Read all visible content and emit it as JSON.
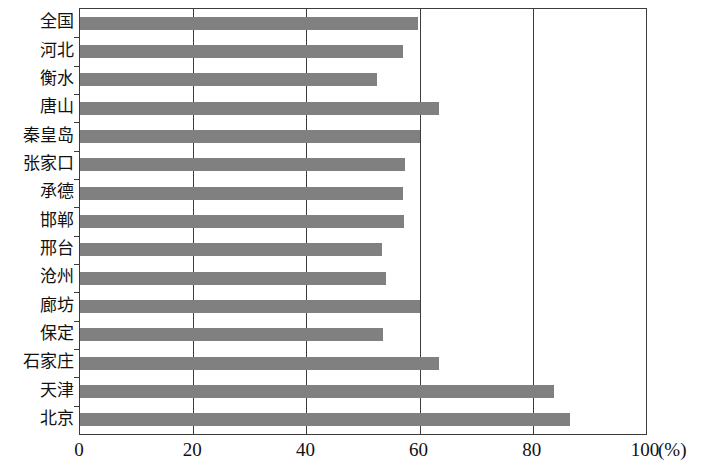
{
  "chart_data": {
    "type": "bar",
    "orientation": "horizontal",
    "title": "",
    "xlabel": "(%)",
    "ylabel": "",
    "xlim": [
      0,
      100
    ],
    "xticks": [
      0,
      20,
      40,
      60,
      80,
      100
    ],
    "grid": true,
    "legend": false,
    "bar_color": "#808080",
    "axis_color": "#3c3c3c",
    "categories": [
      "全国",
      "河北",
      "衡水",
      "唐山",
      "秦皇岛",
      "张家口",
      "承德",
      "邯郸",
      "邢台",
      "沧州",
      "廊坊",
      "保定",
      "石家庄",
      "天津",
      "北京"
    ],
    "values": [
      59.8,
      57.0,
      52.5,
      63.5,
      60.0,
      57.5,
      57.0,
      57.3,
      53.3,
      54.0,
      60.0,
      53.5,
      63.5,
      83.8,
      86.5
    ],
    "unit": "%"
  }
}
